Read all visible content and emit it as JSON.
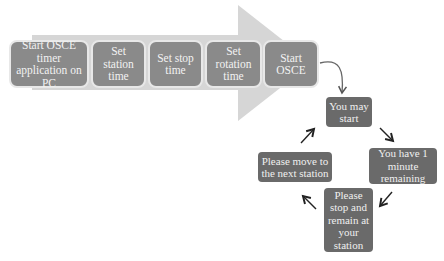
{
  "diagram": {
    "pipeline": [
      {
        "id": "start-app",
        "label": "Start OSCE timer application on PC"
      },
      {
        "id": "station-time",
        "label": "Set station time"
      },
      {
        "id": "stop-time",
        "label": "Set stop time"
      },
      {
        "id": "rotation-time",
        "label": "Set rotation time"
      },
      {
        "id": "start-osce",
        "label": "Start OSCE"
      }
    ],
    "cycle": [
      {
        "id": "may-start",
        "label": "You may start"
      },
      {
        "id": "one-minute",
        "label": "You have 1 minute remaining"
      },
      {
        "id": "stop-remain",
        "label": "Please stop and remain at your station"
      },
      {
        "id": "move-next",
        "label": "Please move to the next station"
      }
    ],
    "colors": {
      "arrow": "#d6d6d6",
      "box": "#8a8a8a",
      "cycle_box": "#6a6a6a",
      "text": "#f2f2f2"
    }
  }
}
